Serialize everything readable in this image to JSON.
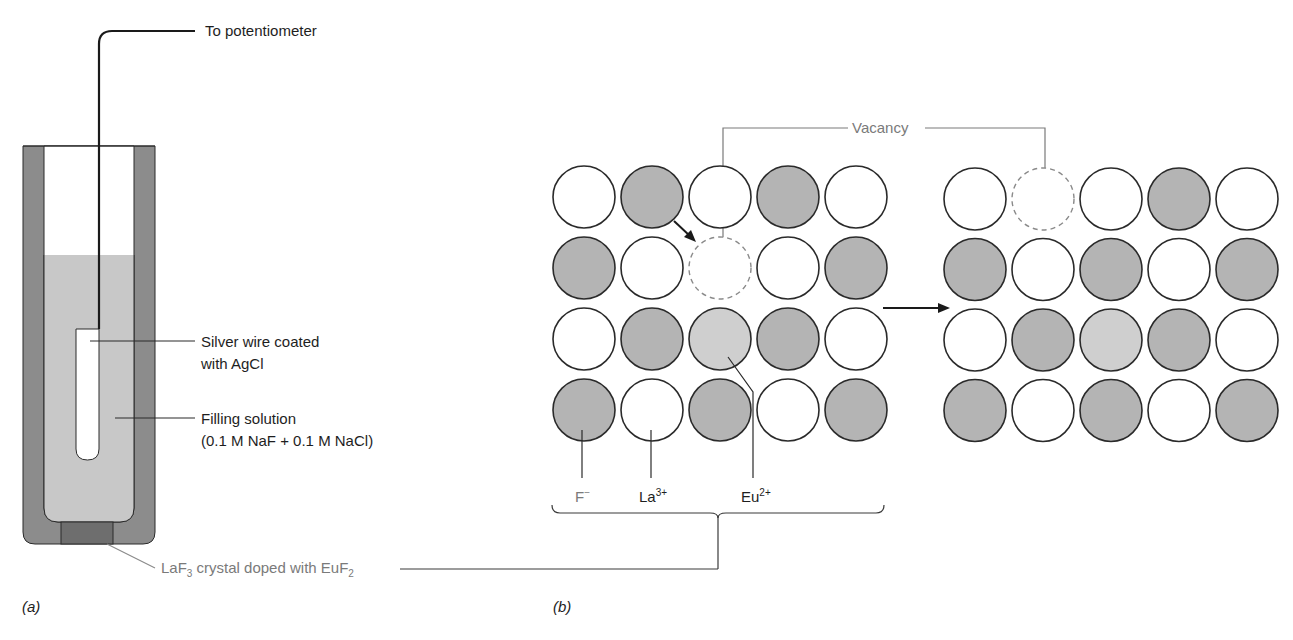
{
  "panel_a": {
    "tag": "(a)",
    "labels": {
      "potentiometer": "To potentiometer",
      "silver_wire_line1": "Silver wire coated",
      "silver_wire_line2": "with AgCl",
      "filling_line1": "Filling solution",
      "filling_line2": "(0.1 M NaF + 0.1 M NaCl)",
      "crystal_prefix": "LaF",
      "crystal_sub1": "3",
      "crystal_mid": " crystal doped with EuF",
      "crystal_sub2": "2"
    }
  },
  "panel_b": {
    "tag": "(b)",
    "vacancy_label": "Vacancy",
    "ion_labels": {
      "fluoride": "F",
      "fluoride_charge": "−",
      "lanthanum": "La",
      "lanthanum_charge": "3+",
      "europium": "Eu",
      "europium_charge": "2+"
    },
    "legend_key": {
      "gray": "F−",
      "white": "La3+",
      "light": "Eu2+",
      "dashed": "vacancy"
    },
    "grid_before": [
      [
        "white",
        "gray",
        "white",
        "gray",
        "white"
      ],
      [
        "gray",
        "white",
        "vacancy",
        "white",
        "gray"
      ],
      [
        "white",
        "gray",
        "light",
        "gray",
        "white"
      ],
      [
        "gray",
        "white",
        "gray",
        "white",
        "gray"
      ]
    ],
    "grid_after": [
      [
        "white",
        "vacancy",
        "white",
        "gray",
        "white"
      ],
      [
        "gray",
        "white",
        "gray",
        "white",
        "gray"
      ],
      [
        "white",
        "gray",
        "light",
        "gray",
        "white"
      ],
      [
        "gray",
        "white",
        "gray",
        "white",
        "gray"
      ]
    ]
  },
  "colors": {
    "electrode_body": "#8c8c8c",
    "filling": "#c8c8c8",
    "crystal": "#6e6e6e",
    "anion_gray": "#b4b4b4",
    "eu_light": "#cfcfcf",
    "outline": "#2a2a2a",
    "label_gray": "#7a7a7a"
  }
}
